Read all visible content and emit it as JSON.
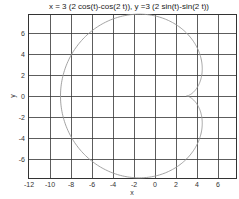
{
  "chart_data": {
    "type": "line",
    "title": "x = 3 (2 cos(t)-cos(2 t)), y =3 (2 sin(t)-sin(2 t))",
    "xlabel": "x",
    "ylabel": "y",
    "xlim": [
      -12,
      7.6
    ],
    "ylim": [
      -7.8,
      7.8
    ],
    "grid": true,
    "x_ticks": [
      -12,
      -10,
      -8,
      -6,
      -4,
      -2,
      0,
      2,
      4,
      6
    ],
    "y_ticks": [
      -6,
      -4,
      -2,
      0,
      2,
      4,
      6
    ],
    "series": [
      {
        "name": "cardioid",
        "parametric": {
          "x": "3*(2*cos(t)-cos(2*t))",
          "y": "3*(2*sin(t)-sin(2*t))",
          "t_range": [
            0,
            6.2832
          ]
        },
        "color": "#999999",
        "key_points": [
          {
            "x": 3,
            "y": 0
          },
          {
            "x": 0,
            "y": 7.79
          },
          {
            "x": -9,
            "y": 0
          },
          {
            "x": 0,
            "y": -7.79
          }
        ]
      }
    ]
  },
  "colors": {
    "grid": "#333333",
    "curve": "#999999",
    "frame": "#333333"
  }
}
